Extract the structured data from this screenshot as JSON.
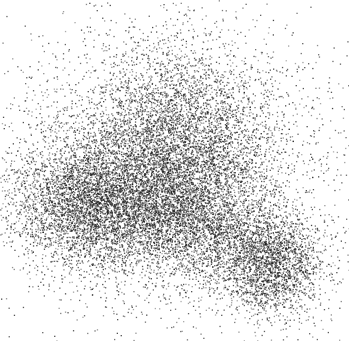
{
  "chart_data": {
    "type": "scatter",
    "title": "",
    "xlabel": "",
    "ylabel": "",
    "axes_visible": false,
    "grid": false,
    "legend": [],
    "point_color": "#1a1a1a",
    "background": "#ffffff",
    "canvas": {
      "width": 349,
      "height": 341
    },
    "clusters": [
      {
        "name": "upper-center",
        "cx": 175,
        "cy": 150,
        "sx": 48,
        "sy": 50,
        "n": 5200,
        "angle": -0.3
      },
      {
        "name": "left",
        "cx": 90,
        "cy": 205,
        "sx": 42,
        "sy": 32,
        "n": 4200,
        "angle": 0.15
      },
      {
        "name": "lower-right",
        "cx": 272,
        "cy": 265,
        "sx": 26,
        "sy": 26,
        "n": 2000,
        "angle": 0
      },
      {
        "name": "bridge",
        "cx": 200,
        "cy": 225,
        "sx": 45,
        "sy": 28,
        "n": 2400,
        "angle": 0.35
      },
      {
        "name": "halo",
        "cx": 180,
        "cy": 170,
        "sx": 95,
        "sy": 80,
        "n": 3200,
        "angle": 0
      }
    ]
  }
}
